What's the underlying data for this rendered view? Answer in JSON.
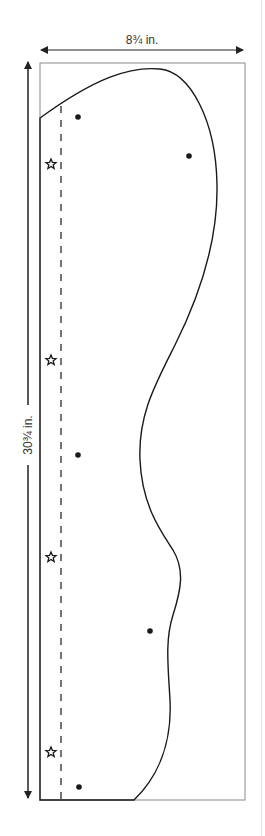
{
  "diagram": {
    "type": "sewing-pattern-piece",
    "width_label": "8¾ in.",
    "height_label": "30¾ in.",
    "colors": {
      "outline": "#1a1a1a",
      "frame": "#8a8a8a",
      "arrow": "#222222",
      "label": "#333333"
    },
    "markers": {
      "dots": [
        {
          "x": 78,
          "y": 117
        },
        {
          "x": 189,
          "y": 156
        },
        {
          "x": 78,
          "y": 455
        },
        {
          "x": 150,
          "y": 631
        },
        {
          "x": 79,
          "y": 787
        }
      ],
      "stars": [
        {
          "x": 51,
          "y": 164
        },
        {
          "x": 51,
          "y": 360
        },
        {
          "x": 51,
          "y": 557
        },
        {
          "x": 51,
          "y": 752
        }
      ]
    },
    "legend_icons": {
      "dot": "dot-marker-icon",
      "star": "star-notch-icon"
    }
  }
}
